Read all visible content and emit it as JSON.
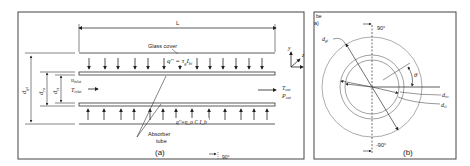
{
  "panel_a": {
    "caption": "(a)",
    "length_label": "L",
    "glass_cover_label": "Glass cover",
    "heat_flux_top": "q'' = τ_g I_b",
    "heat_flux_top_main": "q''",
    "heat_flux_top_rest": " = τ",
    "heat_flux_top_sub1": "g",
    "heat_flux_top_I": "I",
    "heat_flux_top_sub2": "bi",
    "heat_flux_bottom": "q''=η_o C I_b",
    "absorber_label_1": "Absorber",
    "absorber_label_2": "tube",
    "inlet_u": "u",
    "inlet_u_sub": "inlet",
    "inlet_T": "T",
    "inlet_T_sub": "inlet",
    "outlet_T": "T",
    "outlet_T_sub": "out",
    "outlet_P": "P",
    "outlet_P_sub": "out",
    "dim_d_gi": "d",
    "dim_d_gi_sub": "gi",
    "dim_d_ro": "d",
    "dim_d_ro_sub": "ro",
    "dim_d_ri": "d",
    "dim_d_ri_sub": "ri",
    "axis_y": "y",
    "axis_z": "z",
    "angle_90": "90°"
  },
  "panel_b": {
    "caption": "(b)",
    "corner_text_1": "be",
    "corner_text_2": "a)",
    "top_angle": "90°",
    "bottom_angle": "-90°",
    "theta": "θ",
    "d_gi": "d",
    "d_gi_sub": "gi",
    "d_ro": "d",
    "d_ro_sub": "ro",
    "d_ri": "d",
    "d_ri_sub": "ri"
  },
  "colors": {
    "line": "#333333",
    "frame": "#444444",
    "circle": "#777777"
  }
}
